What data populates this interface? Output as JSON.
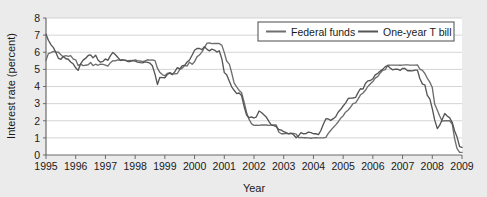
{
  "chart_data": {
    "type": "line",
    "title": "",
    "xlabel": "Year",
    "ylabel": "Interest rate (percent)",
    "xlim": [
      1995,
      2009
    ],
    "ylim": [
      0,
      8
    ],
    "grid": true,
    "legend_position": "top-right",
    "xticks": [
      "1995",
      "1996",
      "1997",
      "1998",
      "1999",
      "2000",
      "2001",
      "2002",
      "2003",
      "2004",
      "2005",
      "2006",
      "2007",
      "2008",
      "2009"
    ],
    "yticks": [
      "0",
      "1",
      "2",
      "3",
      "4",
      "5",
      "6",
      "7",
      "8"
    ],
    "series": [
      {
        "name": "Federal funds",
        "color": "#6e6e6e",
        "x": [
          1995.0,
          1995.08,
          1995.17,
          1995.25,
          1995.33,
          1995.42,
          1995.5,
          1995.58,
          1995.67,
          1995.75,
          1995.83,
          1995.92,
          1996.0,
          1996.08,
          1996.17,
          1996.25,
          1996.33,
          1996.42,
          1996.5,
          1996.58,
          1996.67,
          1996.75,
          1996.83,
          1996.92,
          1997.0,
          1997.08,
          1997.17,
          1997.25,
          1997.33,
          1997.42,
          1997.5,
          1997.58,
          1997.67,
          1997.75,
          1997.83,
          1997.92,
          1998.0,
          1998.08,
          1998.17,
          1998.25,
          1998.33,
          1998.42,
          1998.5,
          1998.58,
          1998.67,
          1998.75,
          1998.83,
          1998.92,
          1999.0,
          1999.08,
          1999.17,
          1999.25,
          1999.33,
          1999.42,
          1999.5,
          1999.58,
          1999.67,
          1999.75,
          1999.83,
          1999.92,
          2000.0,
          2000.08,
          2000.17,
          2000.25,
          2000.33,
          2000.42,
          2000.5,
          2000.58,
          2000.67,
          2000.75,
          2000.83,
          2000.92,
          2001.0,
          2001.08,
          2001.17,
          2001.25,
          2001.33,
          2001.42,
          2001.5,
          2001.58,
          2001.67,
          2001.75,
          2001.83,
          2001.92,
          2002.0,
          2002.08,
          2002.17,
          2002.25,
          2002.33,
          2002.42,
          2002.5,
          2002.58,
          2002.67,
          2002.75,
          2002.83,
          2002.92,
          2003.0,
          2003.08,
          2003.17,
          2003.25,
          2003.33,
          2003.42,
          2003.5,
          2003.58,
          2003.67,
          2003.75,
          2003.83,
          2003.92,
          2004.0,
          2004.08,
          2004.17,
          2004.25,
          2004.33,
          2004.42,
          2004.5,
          2004.58,
          2004.67,
          2004.75,
          2004.83,
          2004.92,
          2005.0,
          2005.08,
          2005.17,
          2005.25,
          2005.33,
          2005.42,
          2005.5,
          2005.58,
          2005.67,
          2005.75,
          2005.83,
          2005.92,
          2006.0,
          2006.08,
          2006.17,
          2006.25,
          2006.33,
          2006.42,
          2006.5,
          2006.58,
          2006.67,
          2006.75,
          2006.83,
          2006.92,
          2007.0,
          2007.08,
          2007.17,
          2007.25,
          2007.33,
          2007.42,
          2007.5,
          2007.58,
          2007.67,
          2007.75,
          2007.83,
          2007.92,
          2008.0,
          2008.08,
          2008.17,
          2008.25,
          2008.33,
          2008.42,
          2008.5,
          2008.58,
          2008.67,
          2008.75,
          2008.83,
          2008.92,
          2009.0
        ],
        "values": [
          5.53,
          5.92,
          5.98,
          6.05,
          6.01,
          6.0,
          5.85,
          5.74,
          5.8,
          5.76,
          5.8,
          5.6,
          5.56,
          5.22,
          5.31,
          5.22,
          5.24,
          5.27,
          5.4,
          5.22,
          5.3,
          5.24,
          5.31,
          5.29,
          5.25,
          5.19,
          5.39,
          5.51,
          5.5,
          5.56,
          5.52,
          5.54,
          5.54,
          5.5,
          5.52,
          5.5,
          5.56,
          5.51,
          5.49,
          5.45,
          5.49,
          5.56,
          5.54,
          5.55,
          5.51,
          5.07,
          4.83,
          4.68,
          4.63,
          4.76,
          4.81,
          4.74,
          4.74,
          4.76,
          4.99,
          5.07,
          5.22,
          5.2,
          5.42,
          5.3,
          5.45,
          5.73,
          5.85,
          6.02,
          6.27,
          6.53,
          6.54,
          6.5,
          6.52,
          6.51,
          6.51,
          6.4,
          5.98,
          5.49,
          5.31,
          4.8,
          4.21,
          3.97,
          3.77,
          3.65,
          3.07,
          2.49,
          2.09,
          1.82,
          1.73,
          1.74,
          1.73,
          1.75,
          1.75,
          1.75,
          1.73,
          1.74,
          1.75,
          1.75,
          1.34,
          1.24,
          1.24,
          1.26,
          1.25,
          1.26,
          1.26,
          1.22,
          1.01,
          1.03,
          1.01,
          1.01,
          1.0,
          0.98,
          1.0,
          1.01,
          1.0,
          1.0,
          1.0,
          1.03,
          1.26,
          1.43,
          1.61,
          1.76,
          1.93,
          2.16,
          2.28,
          2.5,
          2.63,
          2.79,
          3.0,
          3.04,
          3.26,
          3.5,
          3.62,
          3.78,
          4.0,
          4.16,
          4.29,
          4.49,
          4.59,
          4.79,
          4.94,
          4.99,
          5.24,
          5.25,
          5.25,
          5.25,
          5.25,
          5.24,
          5.25,
          5.26,
          5.26,
          5.25,
          5.25,
          5.25,
          5.26,
          5.02,
          4.94,
          4.76,
          4.49,
          4.24,
          3.94,
          2.98,
          2.61,
          2.28,
          1.98,
          2.0,
          2.01,
          2.0,
          1.81,
          0.97,
          0.39,
          0.16,
          0.15
        ]
      },
      {
        "name": "One-year T bill",
        "color": "#555555",
        "x": [
          1995.0,
          1995.08,
          1995.17,
          1995.25,
          1995.33,
          1995.42,
          1995.5,
          1995.58,
          1995.67,
          1995.75,
          1995.83,
          1995.92,
          1996.0,
          1996.08,
          1996.17,
          1996.25,
          1996.33,
          1996.42,
          1996.5,
          1996.58,
          1996.67,
          1996.75,
          1996.83,
          1996.92,
          1997.0,
          1997.08,
          1997.17,
          1997.25,
          1997.33,
          1997.42,
          1997.5,
          1997.58,
          1997.67,
          1997.75,
          1997.83,
          1997.92,
          1998.0,
          1998.08,
          1998.17,
          1998.25,
          1998.33,
          1998.42,
          1998.5,
          1998.58,
          1998.67,
          1998.75,
          1998.83,
          1998.92,
          1999.0,
          1999.08,
          1999.17,
          1999.25,
          1999.33,
          1999.42,
          1999.5,
          1999.58,
          1999.67,
          1999.75,
          1999.83,
          1999.92,
          2000.0,
          2000.08,
          2000.17,
          2000.25,
          2000.33,
          2000.42,
          2000.5,
          2000.58,
          2000.67,
          2000.75,
          2000.83,
          2000.92,
          2001.0,
          2001.08,
          2001.17,
          2001.25,
          2001.33,
          2001.42,
          2001.5,
          2001.58,
          2001.67,
          2001.75,
          2001.83,
          2001.92,
          2002.0,
          2002.08,
          2002.17,
          2002.25,
          2002.33,
          2002.42,
          2002.5,
          2002.58,
          2002.67,
          2002.75,
          2002.83,
          2002.92,
          2003.0,
          2003.08,
          2003.17,
          2003.25,
          2003.33,
          2003.42,
          2003.5,
          2003.58,
          2003.67,
          2003.75,
          2003.83,
          2003.92,
          2004.0,
          2004.08,
          2004.17,
          2004.25,
          2004.33,
          2004.42,
          2004.5,
          2004.58,
          2004.67,
          2004.75,
          2004.83,
          2004.92,
          2005.0,
          2005.08,
          2005.17,
          2005.25,
          2005.33,
          2005.42,
          2005.5,
          2005.58,
          2005.67,
          2005.75,
          2005.83,
          2005.92,
          2006.0,
          2006.08,
          2006.17,
          2006.25,
          2006.33,
          2006.42,
          2006.5,
          2006.58,
          2006.67,
          2006.75,
          2006.83,
          2006.92,
          2007.0,
          2007.08,
          2007.17,
          2007.25,
          2007.33,
          2007.42,
          2007.5,
          2007.58,
          2007.67,
          2007.75,
          2007.83,
          2007.92,
          2008.0,
          2008.08,
          2008.17,
          2008.25,
          2008.33,
          2008.42,
          2008.5,
          2008.58,
          2008.67,
          2008.75,
          2008.83,
          2008.92,
          2009.0
        ],
        "values": [
          7.05,
          6.7,
          6.43,
          6.27,
          6.0,
          5.64,
          5.59,
          5.75,
          5.62,
          5.59,
          5.43,
          5.31,
          5.09,
          4.94,
          5.34,
          5.54,
          5.64,
          5.81,
          5.85,
          5.67,
          5.83,
          5.55,
          5.42,
          5.47,
          5.61,
          5.53,
          5.8,
          5.99,
          5.87,
          5.69,
          5.54,
          5.56,
          5.52,
          5.46,
          5.46,
          5.53,
          5.48,
          5.42,
          5.39,
          5.38,
          5.44,
          5.41,
          5.36,
          5.21,
          4.71,
          4.12,
          4.53,
          4.52,
          4.51,
          4.7,
          4.78,
          4.69,
          4.85,
          5.1,
          5.03,
          5.2,
          5.25,
          5.43,
          5.55,
          5.84,
          6.12,
          6.22,
          6.22,
          6.15,
          6.33,
          6.17,
          6.08,
          6.18,
          6.13,
          6.01,
          6.09,
          5.6,
          4.81,
          4.68,
          4.3,
          3.98,
          3.78,
          3.58,
          3.62,
          3.47,
          2.82,
          2.33,
          2.18,
          2.22,
          2.16,
          2.23,
          2.57,
          2.48,
          2.35,
          2.2,
          1.96,
          1.76,
          1.72,
          1.65,
          1.49,
          1.45,
          1.36,
          1.3,
          1.24,
          1.27,
          1.18,
          1.01,
          1.12,
          1.31,
          1.24,
          1.25,
          1.34,
          1.31,
          1.24,
          1.24,
          1.19,
          1.43,
          1.78,
          2.12,
          2.1,
          2.02,
          2.12,
          2.23,
          2.5,
          2.67,
          2.86,
          3.03,
          3.3,
          3.32,
          3.33,
          3.36,
          3.64,
          3.87,
          3.85,
          4.18,
          4.33,
          4.35,
          4.45,
          4.68,
          4.77,
          4.9,
          5.0,
          5.16,
          5.22,
          5.08,
          4.97,
          5.01,
          5.01,
          4.94,
          5.06,
          5.05,
          4.92,
          4.93,
          4.91,
          4.96,
          4.96,
          4.47,
          4.14,
          4.1,
          3.5,
          3.26,
          2.71,
          2.05,
          1.54,
          1.74,
          2.06,
          2.42,
          2.28,
          2.18,
          1.91,
          1.42,
          1.07,
          0.49,
          0.44
        ]
      }
    ]
  },
  "legend": {
    "items": [
      {
        "label": "Federal funds"
      },
      {
        "label": "One-year T bill"
      }
    ]
  },
  "axes": {
    "y_title": "Interest rate (percent)",
    "x_title": "Year"
  }
}
